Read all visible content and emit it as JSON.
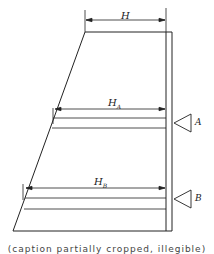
{
  "diagram": {
    "type": "cross-section with dimensioned widths",
    "shape": "trapezoid (sloped left wall, vertical right wall)",
    "labels": {
      "top_width": "H",
      "level_a_width": "H",
      "level_a_sub": "A",
      "level_b_width": "H",
      "level_b_sub": "B",
      "marker_a": "A",
      "marker_b": "B"
    },
    "caption": "(caption partially cropped, illegible)"
  },
  "colors": {
    "line": "#222222",
    "background": "#ffffff"
  }
}
